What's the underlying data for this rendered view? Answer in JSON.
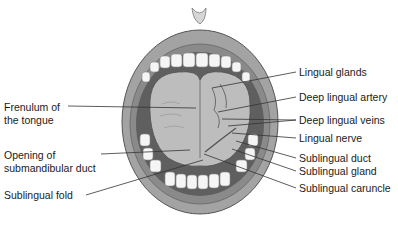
{
  "figure": {
    "labels_left": [
      {
        "line1": "Frenulum of",
        "line2": "the tongue"
      },
      {
        "line1": "Opening of",
        "line2": "submandibular duct"
      },
      {
        "line1": "Sublingual fold",
        "line2": ""
      }
    ],
    "labels_right": [
      "Lingual glands",
      "Deep lingual artery",
      "Deep lingual veins",
      "Lingual nerve",
      "Sublingual duct",
      "Sublingual gland",
      "Sublingual caruncle"
    ],
    "colors": {
      "line": "#333333",
      "lip": "#9a9a9a",
      "lip_dark": "#6f6f6f",
      "teeth": "#f4f4f4",
      "tongue": "#b8b8b8",
      "cavity": "#5a5a5a"
    }
  }
}
